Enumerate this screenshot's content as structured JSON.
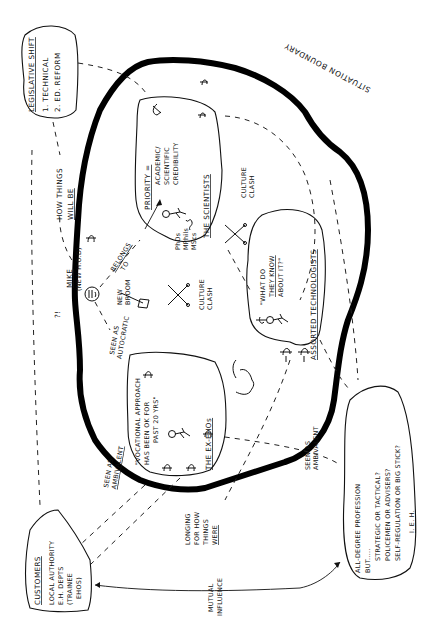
{
  "diagram": {
    "type": "rich-picture",
    "orientation": "rotated-90-ccw",
    "boundary_label": "SITUATION BOUNDARY",
    "clouds": {
      "legislative": {
        "title": "LEGISLATIVE SHIFT",
        "items": [
          "1. TECHNICAL",
          "2. ED. REFORM"
        ]
      },
      "customers": {
        "title": "CUSTOMERS",
        "lines": [
          "LOCAL AUTHORITY",
          "E.H. DEPTS",
          "(TRAINEE",
          "EHOS)"
        ]
      },
      "profession": {
        "lines": [
          "ALL-DEGREE PROFESSION",
          "BUT.....",
          "STRATEGIC OR TACTICAL?",
          "POLICEMEN OR ADVISERS?",
          "SELF-REGULATION OR BIG STICK?"
        ],
        "footer": "I. E. H."
      },
      "scientists": {
        "title": "THE SCIENTISTS",
        "priority_label": "PRIORITY =",
        "priority_lines": [
          "ACADEMIC/",
          "SCIENTIFIC",
          "CREDIBILITY"
        ],
        "degrees": [
          "PhDs",
          "MPhils",
          "MScs"
        ]
      },
      "technologists": {
        "title": "ASSORTED TECHNOLOGISTS",
        "quote_lines": [
          "\"WHAT DO",
          "THEY KNOW",
          "ABOUT IT?\""
        ]
      },
      "exehos": {
        "title": "THE EX-EHOs",
        "quote_lines": [
          "\"VOCATIONAL APPROACH",
          "HAS BEEN OK FOR",
          "PAST 20 YRS\""
        ]
      }
    },
    "actors": {
      "mike": {
        "name": "MIKE",
        "role": "(NEW H.O.D)",
        "exclaim": "?!"
      }
    },
    "labels": {
      "how_things_will_be_1": "HOW THINGS",
      "how_things_will_be_2": "WILL BE",
      "belongs_to_1": "BELONGS",
      "belongs_to_2": "TO",
      "new_broom_1": "NEW",
      "new_broom_2": "BROOM",
      "culture_clash_1": "CULTURE",
      "culture_clash_2": "CLASH",
      "seen_autocratic_1": "SEEN AS",
      "seen_autocratic_2": "AUTOCRATIC",
      "seen_ambivalent_1": "SEEN AS",
      "seen_ambivalent_2": "AMBIVALENT",
      "longing_1": "LONGING",
      "longing_2": "FOR HOW",
      "longing_3": "THINGS",
      "longing_4": "WERE",
      "mutual_1": "MUTUAL",
      "mutual_2": "INFLUENCE"
    },
    "colors": {
      "ink": "#111111",
      "paper": "#ffffff"
    }
  }
}
